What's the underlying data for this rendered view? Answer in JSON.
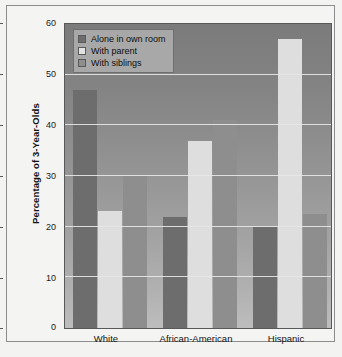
{
  "chart_data": {
    "type": "bar",
    "title": "",
    "xlabel": "",
    "ylabel": "Percentage of 3-Year-Olds",
    "ylim": [
      0,
      60
    ],
    "yticks": [
      0,
      10,
      20,
      30,
      40,
      50,
      60
    ],
    "ytick_labels": [
      "0",
      "10",
      "20",
      "30",
      "40",
      "50",
      "60"
    ],
    "grid": true,
    "legend_position": "upper-left",
    "categories": [
      "White",
      "African-American",
      "Hispanic"
    ],
    "series": [
      {
        "name": "Alone in own room",
        "values": [
          47,
          22,
          20
        ],
        "color": "#6d6d6d"
      },
      {
        "name": "With parent",
        "values": [
          23,
          37,
          57
        ],
        "color": "#dedede"
      },
      {
        "name": "With siblings",
        "values": [
          30,
          41,
          22.5
        ],
        "color": "#8e8e8e"
      }
    ]
  },
  "colors": {
    "plot_background_top": "#7b7b7b",
    "plot_background_bottom": "#bdbdbd",
    "figure_background": "#f3f3f1",
    "gridline": "#e6e6e4",
    "axis": "#58595b",
    "legend_background": "#a8a8a8",
    "legend_border": "#6f6f6f",
    "text": "#111111"
  }
}
